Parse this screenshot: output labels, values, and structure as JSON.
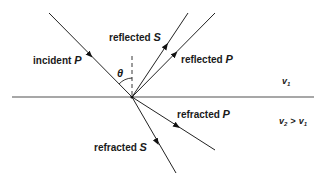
{
  "diagram": {
    "labels": {
      "incident_p": {
        "word": "incident",
        "sym": "P"
      },
      "reflected_s": {
        "word": "reflected",
        "sym": "S"
      },
      "reflected_p": {
        "word": "reflected",
        "sym": "P"
      },
      "refracted_p": {
        "word": "refracted",
        "sym": "P"
      },
      "refracted_s": {
        "word": "refracted",
        "sym": "S"
      },
      "angle": "θ",
      "v1": {
        "base": "v",
        "sub": "1"
      },
      "v2_relation": {
        "base": "v",
        "sub": "2",
        "op": ">",
        "base2": "v",
        "sub2": "1"
      }
    },
    "colors": {
      "line": "#222222",
      "interface": "#888888"
    }
  }
}
